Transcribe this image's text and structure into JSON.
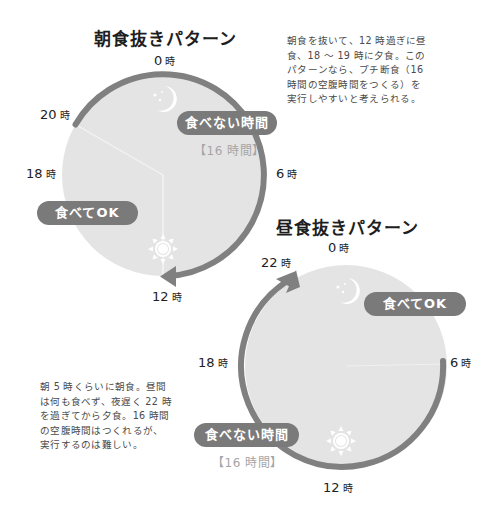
{
  "colors": {
    "clock_face": "#e4e4e4",
    "arc": "#808080",
    "pill_bg": "#7a7a7a",
    "pill_text": "#ffffff",
    "sub_text": "#a5a5a5",
    "icon": "#ffffff"
  },
  "pattern1": {
    "title": "朝食抜きパターン",
    "hours": [
      {
        "num": "0",
        "unit": "時"
      },
      {
        "num": "20",
        "unit": "時"
      },
      {
        "num": "18",
        "unit": "時"
      },
      {
        "num": "6",
        "unit": "時"
      },
      {
        "num": "12",
        "unit": "時"
      }
    ],
    "no_eat_label": "食べない時間",
    "no_eat_duration": "【16 時間】",
    "eat_ok_label": "食べてOK",
    "icons": [
      "moon-stars-icon",
      "sun-icon"
    ],
    "description": "朝食を抜いて、12 時過ぎに昼食、18 〜 19 時に夕食。このパターンなら、プチ断食（16 時間の空腹時間をつくる）を実行しやすいと考えられる。",
    "description_lines": [
      "朝食を抜いて、12 時過ぎに昼",
      "食、18 〜 19 時に夕食。この",
      "パターンなら、プチ断食（16",
      "時間の空腹時間をつくる）を",
      "実行しやすいと考えられる。"
    ],
    "fasting_window": {
      "start_hour": 20,
      "end_hour": 12,
      "hours": 16
    },
    "eating_window": {
      "start_hour": 12,
      "end_hour": 20
    }
  },
  "pattern2": {
    "title": "昼食抜きパターン",
    "hours": [
      {
        "num": "0",
        "unit": "時"
      },
      {
        "num": "22",
        "unit": "時"
      },
      {
        "num": "18",
        "unit": "時"
      },
      {
        "num": "6",
        "unit": "時"
      },
      {
        "num": "12",
        "unit": "時"
      }
    ],
    "no_eat_label": "食べない時間",
    "no_eat_duration": "【16 時間】",
    "eat_ok_label": "食べてOK",
    "icons": [
      "moon-stars-icon",
      "sun-icon"
    ],
    "description": "朝 5 時くらいに朝食。昼間は何も食べず、夜遅く 22 時を過ぎてから夕食。16 時間の空腹時間はつくれるが、実行するのは難しい。",
    "description_lines": [
      "朝 5 時くらいに朝食。昼間",
      "は何も食べず、夜遅く 22 時",
      "を過ぎてから夕食。16 時間",
      "の空腹時間はつくれるが、",
      "実行するのは難しい。"
    ],
    "fasting_window": {
      "start_hour": 6,
      "end_hour": 22,
      "hours": 16
    },
    "eating_window": {
      "start_hour": 22,
      "end_hour": 6
    }
  }
}
